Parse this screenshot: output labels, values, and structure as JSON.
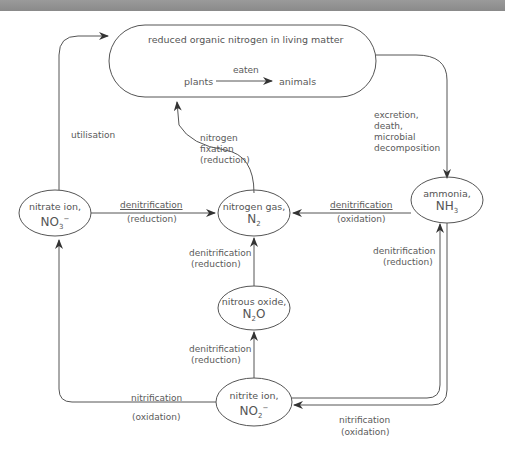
{
  "diagram": {
    "nodes": {
      "living_matter": {
        "label": "reduced organic nitrogen in living matter",
        "from": "plants",
        "to": "animals",
        "arrow_label": "eaten"
      },
      "nitrate": {
        "name": "nitrate ion,",
        "formula": "NO",
        "sub": "3",
        "sup": "−"
      },
      "nitrogen_gas": {
        "name": "nitrogen gas,",
        "formula": "N",
        "sub": "2",
        "sup": ""
      },
      "ammonia": {
        "name": "ammonia,",
        "formula": "NH",
        "sub": "3",
        "sup": ""
      },
      "nitrous_oxide": {
        "name": "nitrous oxide,",
        "formula": "N",
        "sub": "2",
        "tail": "O"
      },
      "nitrite": {
        "name": "nitrite ion,",
        "formula": "NO",
        "sub": "2",
        "sup": "−"
      }
    },
    "edges": {
      "utilisation": "utilisation",
      "fixation": [
        "nitrogen",
        "fixation",
        "(reduction)"
      ],
      "excretion": [
        "excretion,",
        "death,",
        "microbial",
        "decomposition"
      ],
      "nitrate_to_n2": [
        "denitrification",
        "(reduction)"
      ],
      "ammonia_to_n2": [
        "denitrification",
        "(oxidation)"
      ],
      "n2o_to_n2": [
        "denitrification",
        "(reduction)"
      ],
      "nitrite_to_n2o": [
        "denitrification",
        "(reduction)"
      ],
      "nitrite_to_ammonia": [
        "denitrification",
        "(reduction)"
      ],
      "nitrite_to_nitrate": [
        "nitrification",
        "(oxidation)"
      ],
      "ammonia_to_nitrite": [
        "nitrification",
        "(oxidation)"
      ]
    }
  }
}
